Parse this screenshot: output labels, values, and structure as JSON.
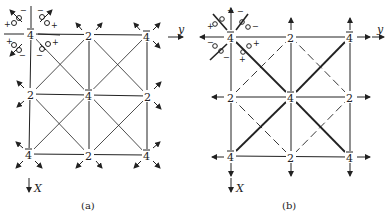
{
  "panels": [
    {
      "id": "a",
      "caption": "(a)",
      "axis_x": "X",
      "axis_y": "y",
      "nodes": [
        {
          "label": "4",
          "bar": true
        },
        {
          "label": "2",
          "bar": false
        },
        {
          "label": "4",
          "bar": true
        },
        {
          "label": "2",
          "bar": false
        },
        {
          "label": "4",
          "bar": true
        },
        {
          "label": "2",
          "bar": false
        },
        {
          "label": "4",
          "bar": true
        },
        {
          "label": "2",
          "bar": false
        },
        {
          "label": "4",
          "bar": true
        }
      ],
      "signs": [
        "−",
        "+",
        "−",
        "+",
        "+",
        "−",
        "−",
        "+"
      ]
    },
    {
      "id": "b",
      "caption": "(b)",
      "axis_x": "X",
      "axis_y": "y",
      "nodes": [
        {
          "label": "4",
          "bar": true
        },
        {
          "label": "2",
          "bar": false
        },
        {
          "label": "4",
          "bar": true
        },
        {
          "label": "2",
          "bar": false
        },
        {
          "label": "4",
          "bar": true
        },
        {
          "label": "2",
          "bar": false
        },
        {
          "label": "4",
          "bar": true
        },
        {
          "label": "2",
          "bar": false
        },
        {
          "label": "4",
          "bar": true
        }
      ],
      "signs": [
        "+",
        "+",
        "−",
        "−",
        "−",
        "−",
        "+",
        "+"
      ]
    }
  ],
  "colors": {
    "ink": "#222222",
    "background": "#ffffff"
  }
}
